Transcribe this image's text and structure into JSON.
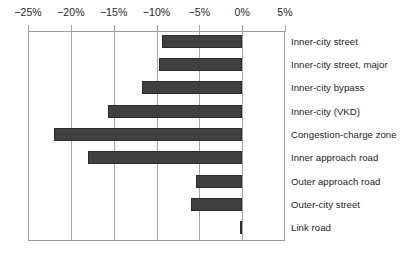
{
  "chart_data": {
    "type": "bar",
    "orientation": "horizontal",
    "title": "",
    "subtitle": "",
    "xlabel": "",
    "ylabel": "",
    "xlim": [
      -25,
      5
    ],
    "ylim": null,
    "grid": true,
    "legend": null,
    "legend_position": "none",
    "xticks": [
      -25,
      -20,
      -15,
      -10,
      -5,
      0,
      5
    ],
    "xtick_labels": [
      "−25%",
      "−20%",
      "−15%",
      "−10%",
      "−5%",
      "0%",
      "5%"
    ],
    "categories": [
      "Inner-city street",
      "Inner-city street, major",
      "Inner-city bypass",
      "Inner-city  (VKD)",
      "Congestion-charge zone",
      "Inner approach road",
      "Outer approach road",
      "Outer-city street",
      "Link road"
    ],
    "values": [
      -9.4,
      -9.7,
      -11.7,
      -15.7,
      -22.0,
      -18.0,
      -5.4,
      -6.0,
      -0.3
    ],
    "bar_color": "#404040",
    "bar_edge_color": "#2b2b2b",
    "axis_color": "#9b9b9b",
    "grid_color": "#a6a6a6",
    "text_color": "#231f20",
    "background_color": "#ffffff"
  }
}
